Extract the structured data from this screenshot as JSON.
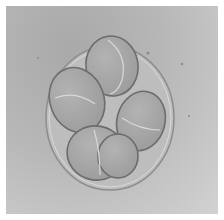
{
  "image": {
    "subject": "micrograph of an 8-cell embryo within zona pellucida",
    "colors": {
      "background": "#b5b5b5",
      "cell": "#a8a8a8",
      "cell_edge": "#6a6a6a",
      "highlight": "#dcdcdc",
      "border": "#ffffff"
    }
  }
}
